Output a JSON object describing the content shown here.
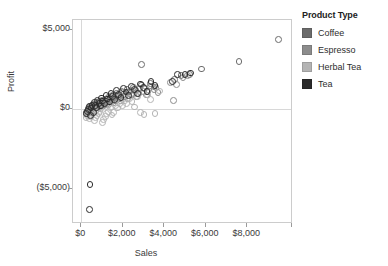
{
  "chart_data": {
    "type": "scatter",
    "title": "",
    "xlabel": "Sales",
    "ylabel": "Profit",
    "xlim": [
      -400,
      10200
    ],
    "ylim": [
      -7200,
      5600
    ],
    "xticks": [
      0,
      2000,
      4000,
      6000,
      8000
    ],
    "xticklabels": [
      "$0",
      "$2,000",
      "$4,000",
      "$6,000",
      "$8,000"
    ],
    "yticks": [
      5000,
      0,
      -5000
    ],
    "yticklabels": [
      "$5,000",
      "$0",
      "($5,000)"
    ],
    "grid": "reference lines at x=$0 and y=$0",
    "legend_position": "right",
    "marker": "open circle",
    "series": [
      {
        "name": "Coffee",
        "color": "#6b6b6b",
        "points": [
          [
            260,
            -180
          ],
          [
            300,
            -120
          ],
          [
            330,
            40
          ],
          [
            360,
            -60
          ],
          [
            390,
            120
          ],
          [
            420,
            -220
          ],
          [
            450,
            180
          ],
          [
            480,
            60
          ],
          [
            510,
            -40
          ],
          [
            540,
            260
          ],
          [
            580,
            140
          ],
          [
            610,
            -100
          ],
          [
            650,
            320
          ],
          [
            690,
            200
          ],
          [
            720,
            80
          ],
          [
            760,
            400
          ],
          [
            800,
            260
          ],
          [
            840,
            140
          ],
          [
            880,
            480
          ],
          [
            920,
            340
          ],
          [
            960,
            220
          ],
          [
            1000,
            560
          ],
          [
            1050,
            420
          ],
          [
            1100,
            300
          ],
          [
            1150,
            640
          ],
          [
            1200,
            500
          ],
          [
            1260,
            380
          ],
          [
            1320,
            720
          ],
          [
            1380,
            580
          ],
          [
            1440,
            460
          ],
          [
            1500,
            860
          ],
          [
            1560,
            700
          ],
          [
            1620,
            560
          ],
          [
            1700,
            980
          ],
          [
            1780,
            820
          ],
          [
            1860,
            660
          ],
          [
            1940,
            1120
          ],
          [
            2020,
            940
          ],
          [
            2100,
            780
          ],
          [
            2200,
            1260
          ],
          [
            2300,
            1080
          ],
          [
            2400,
            900
          ],
          [
            2520,
            1380
          ],
          [
            2640,
            1180
          ],
          [
            2760,
            1000
          ],
          [
            2900,
            1520
          ],
          [
            3040,
            1300
          ],
          [
            3180,
            1100
          ],
          [
            3340,
            1620
          ],
          [
            3500,
            1400
          ],
          [
            4500,
            1880
          ],
          [
            4800,
            2100
          ],
          [
            5200,
            2180
          ],
          [
            5800,
            2520
          ],
          [
            7600,
            3000
          ],
          [
            9500,
            4400
          ],
          [
            2900,
            2800
          ]
        ]
      },
      {
        "name": "Espresso",
        "color": "#8c8c8c",
        "points": [
          [
            240,
            -300
          ],
          [
            280,
            -160
          ],
          [
            320,
            -20
          ],
          [
            370,
            100
          ],
          [
            410,
            -240
          ],
          [
            460,
            200
          ],
          [
            500,
            40
          ],
          [
            550,
            -120
          ],
          [
            600,
            300
          ],
          [
            660,
            160
          ],
          [
            710,
            -60
          ],
          [
            770,
            380
          ],
          [
            830,
            240
          ],
          [
            890,
            100
          ],
          [
            950,
            520
          ],
          [
            1020,
            360
          ],
          [
            1090,
            200
          ],
          [
            1160,
            640
          ],
          [
            1240,
            460
          ],
          [
            1320,
            300
          ],
          [
            1400,
            780
          ],
          [
            1490,
            600
          ],
          [
            1580,
            420
          ],
          [
            1680,
            900
          ],
          [
            1780,
            720
          ],
          [
            1880,
            540
          ],
          [
            2000,
            1040
          ],
          [
            2120,
            840
          ],
          [
            2240,
            660
          ],
          [
            2380,
            1180
          ],
          [
            2520,
            980
          ],
          [
            2660,
            780
          ],
          [
            2820,
            1320
          ],
          [
            2980,
            1100
          ],
          [
            3140,
            900
          ],
          [
            3320,
            1460
          ],
          [
            3500,
            1240
          ],
          [
            3700,
            1040
          ],
          [
            4300,
            1700
          ],
          [
            4600,
            1560
          ],
          [
            4900,
            2000
          ],
          [
            5100,
            2120
          ],
          [
            3600,
            1380
          ],
          [
            4450,
            560
          ]
        ]
      },
      {
        "name": "Herbal Tea",
        "color": "#b4b4b4",
        "points": [
          [
            230,
            -520
          ],
          [
            270,
            -380
          ],
          [
            310,
            -240
          ],
          [
            350,
            -100
          ],
          [
            400,
            -600
          ],
          [
            440,
            -460
          ],
          [
            490,
            -320
          ],
          [
            540,
            -180
          ],
          [
            590,
            -40
          ],
          [
            640,
            -700
          ],
          [
            700,
            -540
          ],
          [
            760,
            -400
          ],
          [
            820,
            -260
          ],
          [
            880,
            -120
          ],
          [
            940,
            20
          ],
          [
            1010,
            -820
          ],
          [
            1080,
            -620
          ],
          [
            1150,
            -440
          ],
          [
            1230,
            -280
          ],
          [
            1310,
            -140
          ],
          [
            1390,
            100
          ],
          [
            1480,
            -360
          ],
          [
            1570,
            -200
          ],
          [
            1660,
            240
          ],
          [
            1760,
            80
          ],
          [
            1860,
            380
          ],
          [
            1970,
            220
          ],
          [
            2080,
            520
          ],
          [
            2190,
            360
          ],
          [
            2310,
            660
          ],
          [
            2440,
            480
          ],
          [
            2570,
            140
          ],
          [
            2720,
            780
          ],
          [
            2870,
            -180
          ],
          [
            3020,
            -320
          ],
          [
            3180,
            900
          ],
          [
            3350,
            620
          ],
          [
            3550,
            -260
          ],
          [
            3750,
            1140
          ]
        ]
      },
      {
        "name": "Tea",
        "color": "#2b2b2b",
        "points": [
          [
            250,
            -280
          ],
          [
            290,
            -140
          ],
          [
            340,
            0
          ],
          [
            380,
            160
          ],
          [
            430,
            -380
          ],
          [
            470,
            80
          ],
          [
            520,
            240
          ],
          [
            570,
            -200
          ],
          [
            620,
            400
          ],
          [
            680,
            260
          ],
          [
            730,
            120
          ],
          [
            790,
            560
          ],
          [
            850,
            380
          ],
          [
            910,
            200
          ],
          [
            970,
            700
          ],
          [
            1040,
            520
          ],
          [
            1110,
            340
          ],
          [
            1190,
            840
          ],
          [
            1270,
            640
          ],
          [
            1350,
            460
          ],
          [
            1430,
            1000
          ],
          [
            1520,
            800
          ],
          [
            1610,
            600
          ],
          [
            1710,
            1160
          ],
          [
            1810,
            940
          ],
          [
            1910,
            740
          ],
          [
            2030,
            1300
          ],
          [
            2150,
            1080
          ],
          [
            2270,
            860
          ],
          [
            2410,
            1440
          ],
          [
            2550,
            1220
          ],
          [
            2690,
            980
          ],
          [
            2850,
            1580
          ],
          [
            3010,
            1340
          ],
          [
            3170,
            1120
          ],
          [
            3360,
            1720
          ],
          [
            3550,
            1480
          ],
          [
            4400,
            1760
          ],
          [
            4650,
            2180
          ],
          [
            5000,
            2160
          ],
          [
            5250,
            2280
          ],
          [
            420,
            -4700
          ],
          [
            400,
            -6300
          ]
        ]
      }
    ]
  },
  "legend": {
    "title": "Product Type",
    "items": [
      {
        "label": "Coffee",
        "color": "#6b6b6b"
      },
      {
        "label": "Espresso",
        "color": "#8c8c8c"
      },
      {
        "label": "Herbal Tea",
        "color": "#b4b4b4"
      },
      {
        "label": "Tea",
        "color": "#2b2b2b"
      }
    ]
  }
}
